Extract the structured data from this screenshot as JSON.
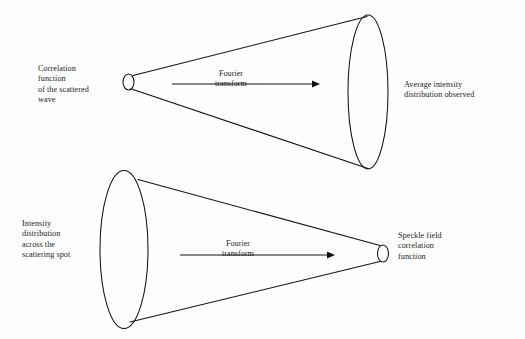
{
  "figure": {
    "background_color": "#fefefe",
    "stroke_color": "#111111",
    "text_color": "#1d1d1d"
  },
  "diagrams": [
    {
      "id": "top-cone",
      "left_label": "Correlation\nfunction\nof the scattered\nwave",
      "right_label": "Average intensity\ndistribution observed",
      "operation_label": "Fourier\ntransform",
      "direction": "left-to-right",
      "apex_side": "left",
      "base_side": "right"
    },
    {
      "id": "bottom-cone",
      "left_label": "Intensity\ndistribution\nacross the\nscattering spot",
      "right_label": "Speckle field\ncorrelation\nfunction",
      "operation_label": "Fourier\ntransform",
      "direction": "left-to-right",
      "apex_side": "right",
      "base_side": "left"
    }
  ],
  "chart_data": {
    "type": "diagram",
    "shapes": [
      {
        "name": "top-cone",
        "kind": "cone",
        "small_end": {
          "cx": 128.5,
          "cy": 82,
          "rx": 5.5,
          "ry": 8
        },
        "large_end": {
          "cx": 368,
          "cy": 92,
          "rx": 20,
          "ry": 77
        },
        "upper_line": {
          "x1": 133,
          "y1": 75.5,
          "x2": 367,
          "y2": 16.5
        },
        "lower_line": {
          "x1": 131.5,
          "y1": 89,
          "x2": 368,
          "y2": 168.5
        },
        "arrow": {
          "x1": 172,
          "y1": 84,
          "x2": 316,
          "y2": 84
        }
      },
      {
        "name": "bottom-cone",
        "kind": "cone",
        "small_end": {
          "cx": 383,
          "cy": 253.5,
          "rx": 5.5,
          "ry": 8.5
        },
        "large_end": {
          "cx": 124,
          "cy": 249.5,
          "rx": 24,
          "ry": 79
        },
        "upper_line": {
          "x1": 138,
          "y1": 179.5,
          "x2": 380,
          "y2": 245.5
        },
        "lower_line": {
          "x1": 130,
          "y1": 322,
          "x2": 380,
          "y2": 261.5
        },
        "arrow": {
          "x1": 180,
          "y1": 255,
          "x2": 331,
          "y2": 255
        }
      }
    ]
  }
}
